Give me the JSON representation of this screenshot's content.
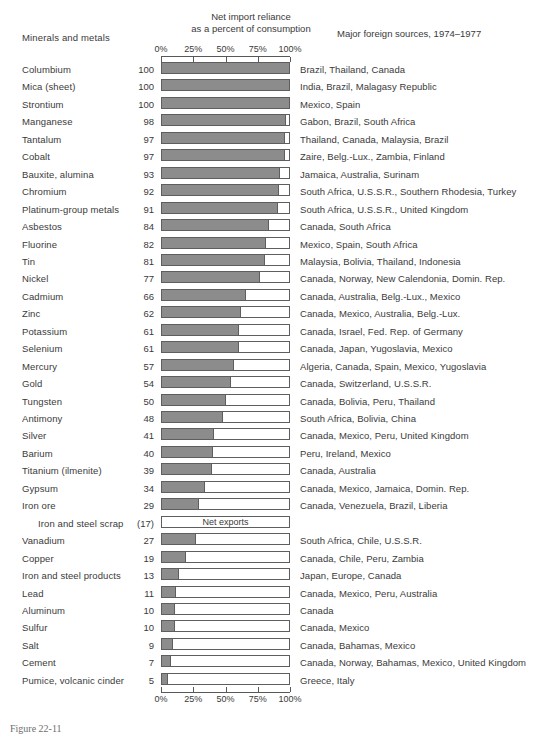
{
  "header": {
    "col_minerals": "Minerals and metals",
    "col_net_line1": "Net import reliance",
    "col_net_line2": "as a percent of consumption",
    "col_sources": "Major foreign sources, 1974–1977"
  },
  "caption": "Figure 22-11",
  "colors": {
    "bar_fill": "#8c8c8c",
    "bar_border": "#5e5e5e",
    "text": "#3a3a3a",
    "background": "#ffffff"
  },
  "chart_data": {
    "type": "bar",
    "orientation": "horizontal",
    "title": "Net import reliance as a percent of consumption",
    "xlabel": "Net import reliance as a percent of consumption",
    "ylabel": "Minerals and metals",
    "xlim": [
      0,
      100
    ],
    "grid": false,
    "legend": null,
    "tick_labels": [
      "0%",
      "25%",
      "50%",
      "75%",
      "100%"
    ],
    "tick_values": [
      0,
      25,
      50,
      75,
      100
    ],
    "axis_top": true,
    "axis_bottom": true,
    "categories": [
      "Columbium",
      "Mica (sheet)",
      "Strontium",
      "Manganese",
      "Tantalum",
      "Cobalt",
      "Bauxite, alumina",
      "Chromium",
      "Platinum-group metals",
      "Asbestos",
      "Fluorine",
      "Tin",
      "Nickel",
      "Cadmium",
      "Zinc",
      "Potassium",
      "Selenium",
      "Mercury",
      "Gold",
      "Tungsten",
      "Antimony",
      "Silver",
      "Barium",
      "Titanium (ilmenite)",
      "Gypsum",
      "Iron ore",
      "Iron and steel scrap",
      "Vanadium",
      "Copper",
      "Iron and steel products",
      "Lead",
      "Aluminum",
      "Sulfur",
      "Salt",
      "Cement",
      "Pumice, volcanic cinder"
    ],
    "values": [
      100,
      100,
      100,
      98,
      97,
      97,
      93,
      92,
      91,
      84,
      82,
      81,
      77,
      66,
      62,
      61,
      61,
      57,
      54,
      50,
      48,
      41,
      40,
      39,
      34,
      29,
      -17,
      27,
      19,
      13,
      11,
      10,
      10,
      9,
      7,
      5
    ],
    "annotations": [
      {
        "category": "Iron and steel scrap",
        "text": "Net exports",
        "value_label": "(17)"
      }
    ]
  },
  "rows": [
    {
      "name": "Columbium",
      "value": "100",
      "pct": 100,
      "sources": "Brazil, Thailand, Canada"
    },
    {
      "name": "Mica (sheet)",
      "value": "100",
      "pct": 100,
      "sources": "India, Brazil, Malagasy Republic"
    },
    {
      "name": "Strontium",
      "value": "100",
      "pct": 100,
      "sources": "Mexico, Spain"
    },
    {
      "name": "Manganese",
      "value": "98",
      "pct": 98,
      "sources": "Gabon, Brazil, South Africa"
    },
    {
      "name": "Tantalum",
      "value": "97",
      "pct": 97,
      "sources": "Thailand, Canada, Malaysia, Brazil"
    },
    {
      "name": "Cobalt",
      "value": "97",
      "pct": 97,
      "sources": "Zaire, Belg.-Lux., Zambia, Finland"
    },
    {
      "name": "Bauxite, alumina",
      "value": "93",
      "pct": 93,
      "sources": "Jamaica, Australia, Surinam"
    },
    {
      "name": "Chromium",
      "value": "92",
      "pct": 92,
      "sources": "South Africa, U.S.S.R., Southern Rhodesia, Turkey"
    },
    {
      "name": "Platinum-group metals",
      "value": "91",
      "pct": 91,
      "sources": "South Africa, U.S.S.R., United Kingdom"
    },
    {
      "name": "Asbestos",
      "value": "84",
      "pct": 84,
      "sources": "Canada, South Africa"
    },
    {
      "name": "Fluorine",
      "value": "82",
      "pct": 82,
      "sources": "Mexico, Spain, South Africa"
    },
    {
      "name": "Tin",
      "value": "81",
      "pct": 81,
      "sources": "Malaysia, Bolivia, Thailand, Indonesia"
    },
    {
      "name": "Nickel",
      "value": "77",
      "pct": 77,
      "sources": "Canada, Norway, New Calendonia, Domin. Rep."
    },
    {
      "name": "Cadmium",
      "value": "66",
      "pct": 66,
      "sources": "Canada, Australia, Belg.-Lux., Mexico"
    },
    {
      "name": "Zinc",
      "value": "62",
      "pct": 62,
      "sources": "Canada, Mexico, Australia, Belg.-Lux."
    },
    {
      "name": "Potassium",
      "value": "61",
      "pct": 61,
      "sources": "Canada, Israel, Fed. Rep. of Germany"
    },
    {
      "name": "Selenium",
      "value": "61",
      "pct": 61,
      "sources": "Canada, Japan, Yugoslavia, Mexico"
    },
    {
      "name": "Mercury",
      "value": "57",
      "pct": 57,
      "sources": "Algeria, Canada, Spain, Mexico, Yugoslavia"
    },
    {
      "name": "Gold",
      "value": "54",
      "pct": 54,
      "sources": "Canada, Switzerland, U.S.S.R."
    },
    {
      "name": "Tungsten",
      "value": "50",
      "pct": 50,
      "sources": "Canada, Bolivia, Peru, Thailand"
    },
    {
      "name": "Antimony",
      "value": "48",
      "pct": 48,
      "sources": "South Africa, Bolivia, China"
    },
    {
      "name": "Silver",
      "value": "41",
      "pct": 41,
      "sources": "Canada, Mexico, Peru, United Kingdom"
    },
    {
      "name": "Barium",
      "value": "40",
      "pct": 40,
      "sources": "Peru, Ireland, Mexico"
    },
    {
      "name": "Titanium (ilmenite)",
      "value": "39",
      "pct": 39,
      "sources": "Canada, Australia"
    },
    {
      "name": "Gypsum",
      "value": "34",
      "pct": 34,
      "sources": "Canada, Mexico, Jamaica, Domin. Rep."
    },
    {
      "name": "Iron ore",
      "value": "29",
      "pct": 29,
      "sources": "Canada, Venezuela, Brazil, Liberia"
    },
    {
      "name": "Iron and steel scrap",
      "value": "(17)",
      "pct": 0,
      "note": "Net exports",
      "sources": "",
      "indent": true
    },
    {
      "name": "Vanadium",
      "value": "27",
      "pct": 27,
      "sources": "South Africa, Chile, U.S.S.R."
    },
    {
      "name": "Copper",
      "value": "19",
      "pct": 19,
      "sources": "Canada, Chile, Peru, Zambia"
    },
    {
      "name": "Iron and steel products",
      "value": "13",
      "pct": 13,
      "sources": "Japan, Europe, Canada"
    },
    {
      "name": "Lead",
      "value": "11",
      "pct": 11,
      "sources": "Canada, Mexico, Peru, Australia"
    },
    {
      "name": "Aluminum",
      "value": "10",
      "pct": 10,
      "sources": "Canada"
    },
    {
      "name": "Sulfur",
      "value": "10",
      "pct": 10,
      "sources": "Canada, Mexico"
    },
    {
      "name": "Salt",
      "value": "9",
      "pct": 9,
      "sources": "Canada, Bahamas, Mexico"
    },
    {
      "name": "Cement",
      "value": "7",
      "pct": 7,
      "sources": "Canada, Norway, Bahamas, Mexico, United Kingdom"
    },
    {
      "name": "Pumice, volcanic cinder",
      "value": "5",
      "pct": 5,
      "sources": "Greece, Italy"
    }
  ]
}
